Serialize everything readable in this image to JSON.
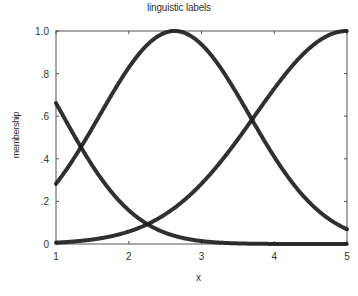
{
  "chart_data": {
    "type": "line",
    "title": "linguistic labels",
    "xlabel": "x",
    "ylabel": "membership",
    "xlim": [
      1,
      5
    ],
    "ylim": [
      0,
      1
    ],
    "x_ticks": [
      "1",
      "2",
      "3",
      "4",
      "5"
    ],
    "y_ticks": [
      "0",
      ".2",
      ".4",
      ".6",
      ".8",
      "1.0"
    ],
    "grid": false,
    "legend": null,
    "series": [
      {
        "name": "low",
        "shape": "gaussian",
        "center": 0.1,
        "sigma": 1.4,
        "x": [
          1.0,
          1.35,
          1.5,
          2.0,
          2.33,
          2.5,
          3.0,
          3.5,
          4.0,
          4.5,
          5.0
        ],
        "values": [
          0.66,
          0.45,
          0.37,
          0.16,
          0.08,
          0.05,
          0.01,
          0.0,
          0.0,
          0.0,
          0.0
        ]
      },
      {
        "name": "medium",
        "shape": "gaussian",
        "center": 2.63,
        "sigma": 1.45,
        "x": [
          1.0,
          1.35,
          1.5,
          2.0,
          2.33,
          2.63,
          3.0,
          3.5,
          3.67,
          4.0,
          4.5,
          5.0
        ],
        "values": [
          0.28,
          0.46,
          0.55,
          0.83,
          0.96,
          1.0,
          0.94,
          0.7,
          0.6,
          0.41,
          0.19,
          0.07
        ]
      },
      {
        "name": "high",
        "shape": "gaussian",
        "center": 5.0,
        "sigma": 1.78,
        "x": [
          1.0,
          1.5,
          2.0,
          2.33,
          2.5,
          3.0,
          3.5,
          3.67,
          4.0,
          4.5,
          5.0
        ],
        "values": [
          0.01,
          0.02,
          0.06,
          0.11,
          0.14,
          0.28,
          0.49,
          0.57,
          0.73,
          0.92,
          1.0
        ]
      }
    ],
    "annotations": []
  },
  "style": {
    "line_color": "#1a1a1a",
    "axis_color": "#555555"
  }
}
